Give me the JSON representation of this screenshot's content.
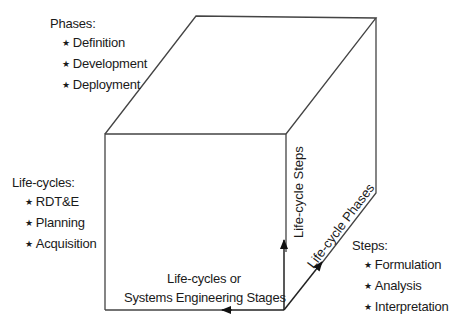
{
  "diagram": {
    "type": "3d-cube",
    "colors": {
      "line": "#444444",
      "text": "#1a1a1a",
      "background": "#ffffff"
    },
    "phases": {
      "title": "Phases:",
      "items": [
        "Definition",
        "Development",
        "Deployment"
      ]
    },
    "life_cycles": {
      "title": "Life-cycles:",
      "items": [
        "RDT&E",
        "Planning",
        "Acquisition"
      ]
    },
    "steps": {
      "title": "Steps:",
      "items": [
        "Formulation",
        "Analysis",
        "Interpretation"
      ]
    },
    "axes": {
      "vertical": "Life-cycle Steps",
      "diagonal": "Life-cycle Phases",
      "horizontal_line1": "Life-cycles or",
      "horizontal_line2": "Systems Engineering Stages"
    },
    "bullet_glyph": "★"
  }
}
